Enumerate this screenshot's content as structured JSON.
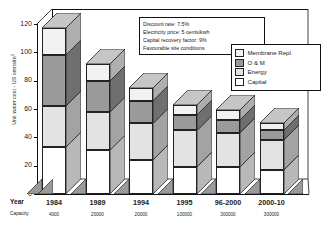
{
  "chart_data": {
    "type": "bar",
    "stacked": true,
    "projection": "3d",
    "title": "",
    "xlabel": "Year",
    "ylabel": "Unit water cost - US cents/m",
    "ylabel_sup": "3",
    "ylim": [
      0,
      120
    ],
    "yticks": [
      0,
      20,
      40,
      60,
      80,
      100,
      120
    ],
    "grid": false,
    "legend_position": "upper-right",
    "categories": [
      "1984",
      "1989",
      "1994",
      "1995",
      "96-2000",
      "2000-10"
    ],
    "secondary_axis_label": "Capacity",
    "capacities": [
      "4000",
      "20000",
      "20000",
      "100000",
      "300000",
      "300000"
    ],
    "series": [
      {
        "name": "Capital",
        "color": "#ffffff",
        "values": [
          33,
          31,
          24,
          19,
          19,
          17
        ]
      },
      {
        "name": "Energy",
        "color": "#e3e3e3",
        "values": [
          29,
          27,
          26,
          26,
          24,
          21
        ]
      },
      {
        "name": "O & M",
        "color": "#9a9a9a",
        "values": [
          36,
          22,
          16,
          11,
          9,
          7
        ]
      },
      {
        "name": "Membrane Repl.",
        "color": "#f2f2f2",
        "values": [
          19,
          12,
          9,
          7,
          7,
          5
        ]
      }
    ],
    "totals": [
      117,
      92,
      75,
      63,
      59,
      50
    ],
    "annotations": [
      "Discount rate:  7.5%",
      "Electricity price:  5 cents/kwh",
      "Capital recovery factor:  9%",
      "Favourable site conditions"
    ]
  },
  "legend": {
    "items": [
      {
        "label": "Membrane Repl."
      },
      {
        "label": "O & M"
      },
      {
        "label": "Energy"
      },
      {
        "label": "Capital"
      }
    ]
  },
  "axis_rows": {
    "year_label": "Year",
    "capacity_label": "Capacity"
  }
}
